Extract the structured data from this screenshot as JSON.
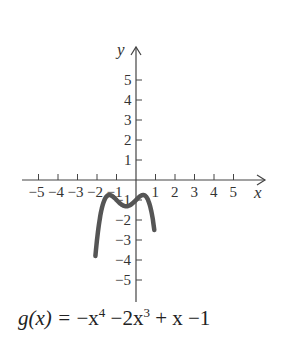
{
  "chart_data": {
    "type": "line",
    "xlabel": "x",
    "ylabel": "y",
    "xlim": [
      -5.5,
      6.5
    ],
    "ylim": [
      -6,
      6.6
    ],
    "x_ticks": [
      -5,
      -4,
      -3,
      -2,
      -1,
      1,
      2,
      3,
      4,
      5
    ],
    "x_tick_labels": [
      "−5",
      "−4",
      "−3",
      "−2",
      "−1",
      "1",
      "2",
      "3",
      "4",
      "5"
    ],
    "y_ticks": [
      5,
      4,
      3,
      2,
      1,
      -1,
      -2,
      -3,
      -4,
      -5
    ],
    "y_tick_labels": [
      "5",
      "4",
      "3",
      "2",
      "1",
      "−1",
      "−2",
      "−3",
      "−4",
      "−5"
    ],
    "grid": false,
    "series": [
      {
        "name": "g(x)",
        "function": "-x^4 - 2x^3 + x - 1",
        "x_range": [
          -2.08,
          0.94
        ],
        "key_points": [
          {
            "x": -2.0,
            "y": -3.0
          },
          {
            "x": -1.37,
            "y": -0.75,
            "note": "local max"
          },
          {
            "x": -0.5,
            "y": -1.31,
            "note": "local min"
          },
          {
            "x": 0.0,
            "y": -1.0
          },
          {
            "x": 0.37,
            "y": -0.75,
            "note": "local max"
          },
          {
            "x": 0.9,
            "y": -5.4
          }
        ],
        "color": "#555555"
      }
    ]
  },
  "labels": {
    "y_axis": "y",
    "x_axis": "x",
    "formula": {
      "lhs": "g(x) = ",
      "t1": "−x",
      "t1_exp": "4",
      "t2": " −2x",
      "t2_exp": "3",
      "t3": " + x",
      "t4": " −1"
    }
  }
}
